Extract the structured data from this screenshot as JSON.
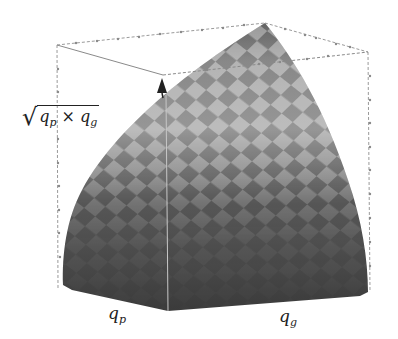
{
  "figure": {
    "type": "3d-surface-plot",
    "colors": {
      "background": "#ffffff",
      "surface_dark": "#3a3a3a",
      "surface_mid": "#6e6e6e",
      "surface_light": "#c8c8c8",
      "box_lines": "#9a9a9a",
      "arrow": "#222222"
    }
  },
  "axes": {
    "z": {
      "radical": "√",
      "var1": "q",
      "sub1": "p",
      "op": "×",
      "var2": "q",
      "sub2": "g"
    },
    "x": {
      "var": "q",
      "sub": "p"
    },
    "y": {
      "var": "q",
      "sub": "g"
    }
  }
}
